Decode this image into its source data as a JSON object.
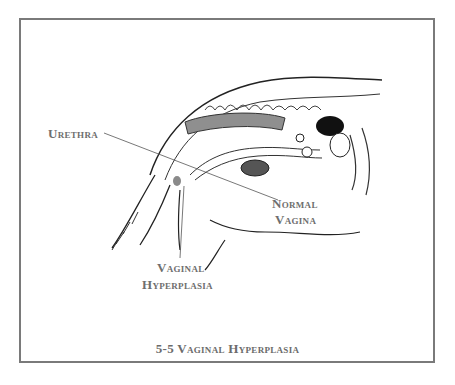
{
  "figure": {
    "caption": "5-5 Vaginal Hyperplasia",
    "labels": {
      "urethra": "Urethra",
      "normal_vagina_line1": "Normal",
      "normal_vagina_line2": "Vagina",
      "vaginal_hyperplasia_line1": "Vaginal",
      "vaginal_hyperplasia_line2": "Hyperplasia"
    },
    "colors": {
      "border": "#7a7a7a",
      "label_text": "#6e6e6e",
      "organ_shade": "#8f8f8f",
      "outline": "#1a1a1a"
    }
  }
}
